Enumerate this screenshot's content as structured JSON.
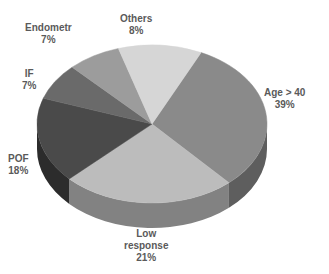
{
  "chart_data": {
    "type": "pie",
    "style": "3d",
    "title": "",
    "legend": "none",
    "slices": [
      {
        "label": "Age > 40",
        "label_lines": [
          "Age > 40"
        ],
        "value": 39,
        "pct_text": "39%",
        "color": "#8a8a8a",
        "side": "#5e5e5e",
        "a0": -64.7,
        "a1": 48,
        "lx": 264,
        "ly": 87
      },
      {
        "label": "Low response",
        "label_lines": [
          "Low",
          "response"
        ],
        "value": 21,
        "pct_text": "21%",
        "color": "#bcbcbc",
        "side": "#828282",
        "a0": 48,
        "a1": 136,
        "lx": 124,
        "ly": 228
      },
      {
        "label": "POF",
        "label_lines": [
          "POF"
        ],
        "value": 18,
        "pct_text": "18%",
        "color": "#4a4a4a",
        "side": "#2c2c2c",
        "a0": 136,
        "a1": 199,
        "lx": 8,
        "ly": 153
      },
      {
        "label": "IF",
        "label_lines": [
          "IF"
        ],
        "value": 7,
        "pct_text": "7%",
        "color": "#6a6a6a",
        "side": "#484848",
        "a0": 199,
        "a1": 226,
        "lx": 22,
        "ly": 68
      },
      {
        "label": "Endometr",
        "label_lines": [
          "Endometr"
        ],
        "value": 7,
        "pct_text": "7%",
        "color": "#9c9c9c",
        "side": "#6e6e6e",
        "a0": 226,
        "a1": 253,
        "lx": 25,
        "ly": 22
      },
      {
        "label": "Others",
        "label_lines": [
          "Others"
        ],
        "value": 8,
        "pct_text": "8%",
        "color": "#d6d6d6",
        "side": "#a8a8a8",
        "a0": 253,
        "a1": 295.3,
        "lx": 120,
        "ly": 13
      }
    ],
    "geometry": {
      "cx": 152,
      "cy": 124,
      "rx": 115,
      "ry": 79,
      "depth": 25
    }
  }
}
